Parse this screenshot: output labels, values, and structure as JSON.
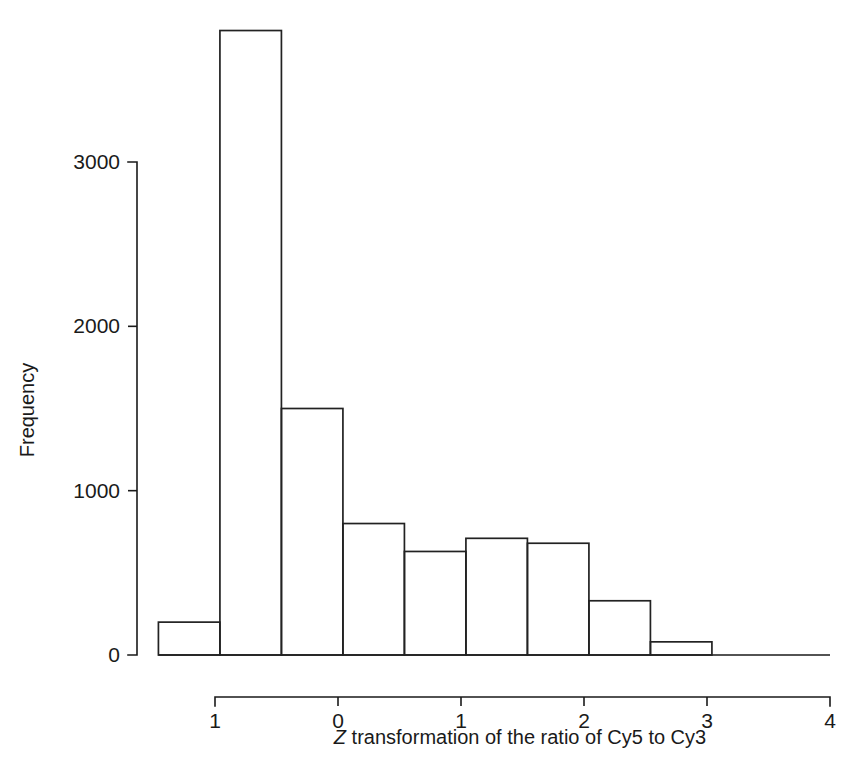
{
  "chart_data": {
    "type": "bar",
    "title": "",
    "subtitle": "",
    "xlabel_parts": {
      "italic": "Z",
      "rest": " transformation of the ratio of Cy5 to Cy3"
    },
    "xlabel": "Z transformation of the ratio of Cy5 to Cy3",
    "ylabel": "Frequency",
    "grid": false,
    "legend": null,
    "xlim": [
      -1.5,
      4.0
    ],
    "ylim": [
      0,
      3850
    ],
    "xticks": [
      -1,
      0,
      1,
      2,
      3,
      4
    ],
    "xtick_labels": [
      "1",
      "0",
      "1",
      "2",
      "3",
      "4"
    ],
    "yticks": [
      0,
      1000,
      2000,
      3000
    ],
    "ytick_labels": [
      "0",
      "1000",
      "2000",
      "3000"
    ],
    "bin_width": 0.5,
    "bin_edges": [
      -1.46,
      -0.96,
      -0.46,
      0.04,
      0.54,
      1.04,
      1.54,
      2.04,
      2.54,
      3.04
    ],
    "categories": [
      "-1.46 to -0.96",
      "-0.96 to -0.46",
      "-0.46 to 0.04",
      "0.04 to 0.54",
      "0.54 to 1.04",
      "1.04 to 1.54",
      "1.54 to 2.04",
      "2.04 to 2.54",
      "2.54 to 3.04"
    ],
    "values": [
      200,
      3800,
      1500,
      800,
      630,
      710,
      680,
      330,
      80
    ],
    "bar_style": {
      "fill": "none",
      "stroke": "#222222"
    }
  },
  "colors": {
    "background": "#ffffff",
    "axis": "#1a1a1a",
    "bar_outline": "#222222"
  }
}
